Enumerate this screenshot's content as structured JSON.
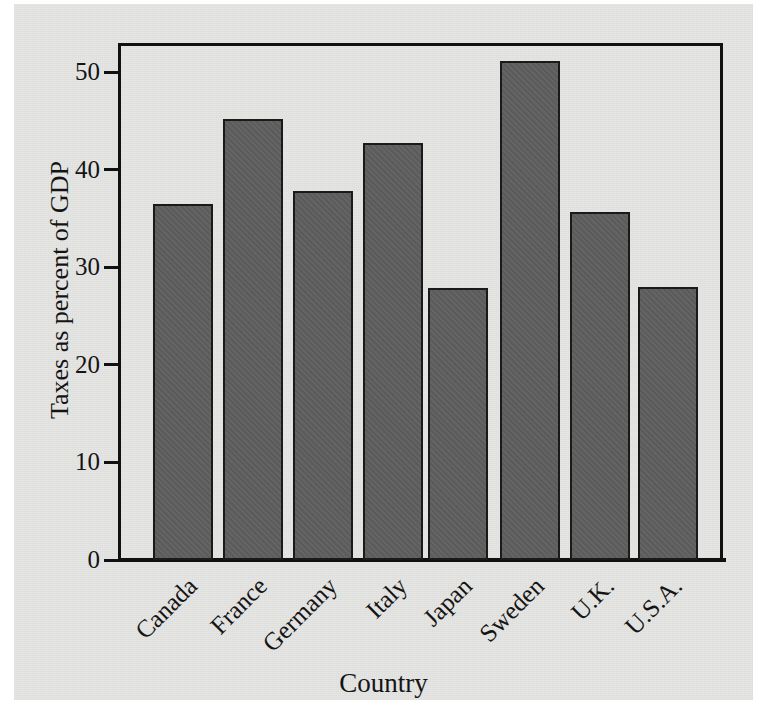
{
  "chart_data": {
    "type": "bar",
    "title": "",
    "xlabel": "Country",
    "ylabel": "Taxes as percent of GDP",
    "categories": [
      "Canada",
      "France",
      "Germany",
      "Italy",
      "Japan",
      "Sweden",
      "U.K.",
      "U.S.A."
    ],
    "values": [
      36.5,
      45.2,
      37.8,
      42.8,
      27.9,
      51.2,
      35.7,
      28.0
    ],
    "ylim": [
      0,
      53
    ],
    "yticks": [
      0,
      10,
      20,
      30,
      40,
      50
    ],
    "ytick_labels": [
      "0",
      "10",
      "20",
      "30",
      "40",
      "50"
    ],
    "grid": false,
    "legend": null,
    "bar_color": "#5e5e5e",
    "bar_edge_color": "#1a1a1a",
    "background_color": "#e6e6e4",
    "axis_color": "#111111"
  },
  "figure": {
    "page_background": "#ffffff"
  }
}
